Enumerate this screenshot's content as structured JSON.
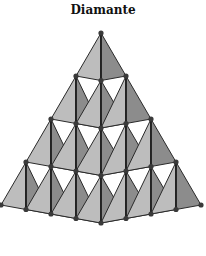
{
  "title": "Diamante",
  "colors": {
    "light_face": "#bdbdbd",
    "dark_face": "#8c8c8c",
    "edge": "#2a2a2a",
    "vertex": "#3a3a3a"
  },
  "layers": 4
}
